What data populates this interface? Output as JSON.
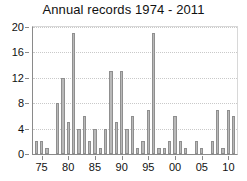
{
  "chart_data": {
    "type": "bar",
    "title": "Annual records 1974 - 2011",
    "xlabel": "",
    "ylabel": "",
    "ylim": [
      0,
      20
    ],
    "xlim": [
      1973.4,
      2011.6
    ],
    "grid": true,
    "legend": null,
    "y_ticks": [
      0,
      4,
      8,
      12,
      16,
      20
    ],
    "y_tick_labels": [
      "0",
      "4",
      "8",
      "12",
      "16",
      "20"
    ],
    "x_ticks": [
      1975,
      1980,
      1985,
      1990,
      1995,
      2000,
      2005,
      2010
    ],
    "x_tick_labels": [
      "75",
      "80",
      "85",
      "90",
      "95",
      "00",
      "05",
      "10"
    ],
    "categories": [
      1974,
      1975,
      1976,
      1977,
      1978,
      1979,
      1980,
      1981,
      1982,
      1983,
      1984,
      1985,
      1986,
      1987,
      1988,
      1989,
      1990,
      1991,
      1992,
      1993,
      1994,
      1995,
      1996,
      1997,
      1998,
      1999,
      2000,
      2001,
      2002,
      2003,
      2004,
      2005,
      2006,
      2007,
      2008,
      2009,
      2010,
      2011
    ],
    "values": [
      2,
      2,
      1,
      0,
      8,
      12,
      5,
      19,
      4,
      6,
      2,
      4,
      1,
      4,
      13,
      5,
      13,
      4,
      6,
      1,
      2,
      7,
      19,
      1,
      1,
      2,
      6,
      2,
      1,
      0,
      2,
      1,
      0,
      2,
      7,
      1,
      7,
      6
    ],
    "bar_color": "#b9b9b9",
    "bar_edge_color": "#8f8f8f",
    "axis_color": "#8a8a8a",
    "grid_color": "#c9c9c9",
    "text_color": "#111111"
  }
}
